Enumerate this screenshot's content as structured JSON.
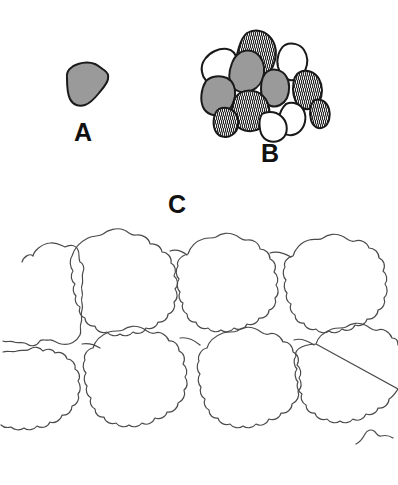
{
  "figure": {
    "caption_labels": {
      "a": "A",
      "b": "B",
      "c": "C"
    },
    "background_color": "#ffffff",
    "outline_color": "#1a1a1a",
    "thin_outline_color": "#4a4a4a",
    "gray_fill_color": "#9a9a9a",
    "white_fill_color": "#ffffff",
    "hatch_fill_color": "#ffffff",
    "hatch_line_color": "#1a1a1a"
  },
  "panels": [
    {
      "id": "panel-a",
      "label": "A",
      "description": "single isolated rounded polygonal cell with gray fill and dark outline",
      "cell_count": 1,
      "cells": [
        {
          "id": "a-cell-1",
          "fill": "gray"
        }
      ]
    },
    {
      "id": "panel-b",
      "label": "B",
      "description": "compact cluster of rounded cells with three fill types: gray, vertically hatched, and white",
      "cell_count": 12,
      "fill_legend": [
        "gray",
        "hatched",
        "white"
      ],
      "cells": [
        {
          "id": "b-cell-1",
          "fill": "hatched"
        },
        {
          "id": "b-cell-2",
          "fill": "white"
        },
        {
          "id": "b-cell-3",
          "fill": "white"
        },
        {
          "id": "b-cell-4",
          "fill": "gray"
        },
        {
          "id": "b-cell-5",
          "fill": "gray"
        },
        {
          "id": "b-cell-6",
          "fill": "gray"
        },
        {
          "id": "b-cell-7",
          "fill": "hatched"
        },
        {
          "id": "b-cell-8",
          "fill": "hatched"
        },
        {
          "id": "b-cell-9",
          "fill": "hatched"
        },
        {
          "id": "b-cell-10",
          "fill": "white"
        },
        {
          "id": "b-cell-11",
          "fill": "white"
        },
        {
          "id": "b-cell-12",
          "fill": "hatched"
        }
      ]
    },
    {
      "id": "panel-c",
      "label": "C",
      "description": "tessellated sheet of large lobed wavy-margined epidermal cells in two rows, unfilled outlines only",
      "cell_count": 9,
      "rows": 2,
      "cells": [
        {
          "id": "c-cell-1",
          "fill": "none",
          "row": 1
        },
        {
          "id": "c-cell-2",
          "fill": "none",
          "row": 1
        },
        {
          "id": "c-cell-3",
          "fill": "none",
          "row": 1
        },
        {
          "id": "c-cell-4",
          "fill": "none",
          "row": 1
        },
        {
          "id": "c-cell-5",
          "fill": "none",
          "row": 2
        },
        {
          "id": "c-cell-6",
          "fill": "none",
          "row": 2
        },
        {
          "id": "c-cell-7",
          "fill": "none",
          "row": 2
        },
        {
          "id": "c-cell-8",
          "fill": "none",
          "row": 2
        },
        {
          "id": "c-cell-9",
          "fill": "none",
          "row": 2
        }
      ]
    }
  ]
}
